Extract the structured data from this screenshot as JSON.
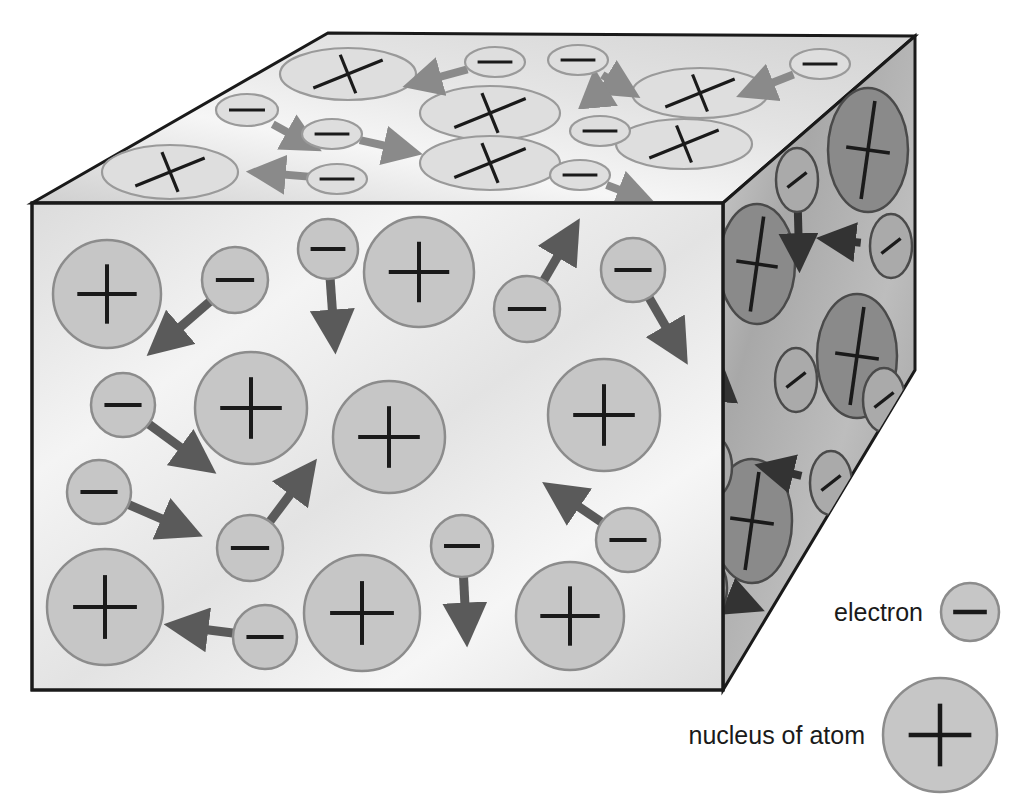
{
  "figure": {
    "background_color": "#ffffff",
    "edge_color": "#1a1a1a"
  },
  "colors": {
    "front_face_light": "#f2f2f2",
    "front_face_mid": "#d9d9d9",
    "front_particle_fill": "#c6c6c6",
    "front_particle_stroke": "#8c8c8c",
    "top_face_light": "#f7f7f7",
    "top_face_mid": "#d4d4d4",
    "top_particle_fill": "#dedede",
    "top_particle_stroke": "#9a9a9a",
    "right_face_light": "#c2c2c2",
    "right_face_mid": "#9c9c9c",
    "right_nucleus_fill": "#8a8a8a",
    "right_electron_fill": "#aaaaaa",
    "right_particle_stroke": "#4a4a4a",
    "arrow_front": "#5a5a5a",
    "arrow_top": "#8a8a8a",
    "arrow_right": "#333333",
    "glyph_color": "#1a1a1a",
    "legend_fill": "#c6c6c6",
    "legend_stroke": "#8c8c8c",
    "legend_text": "#1a1a1a"
  },
  "geometry": {
    "front_face": {
      "x1": 32,
      "y1": 203,
      "x2": 723,
      "y2": 690
    },
    "top_face_points": "32,203 328,33 915,36 723,203",
    "right_face_points": "723,203 915,36 915,370 723,690",
    "cube_note": "isometric block: front rectangle, top parallelogram, right face"
  },
  "legend": {
    "items": [
      {
        "label": "electron",
        "symbol": "minus",
        "cx": 970,
        "cy": 612,
        "r": 29
      },
      {
        "label": "nucleus of atom",
        "symbol": "plus",
        "cx": 940,
        "cy": 735,
        "r": 57
      }
    ]
  },
  "chart_data": {
    "type": "diagram",
    "front_face": {
      "nuclei": [
        {
          "cx": 107,
          "cy": 294,
          "r": 54
        },
        {
          "cx": 251,
          "cy": 408,
          "r": 56
        },
        {
          "cx": 419,
          "cy": 272,
          "r": 55
        },
        {
          "cx": 389,
          "cy": 437,
          "r": 56
        },
        {
          "cx": 604,
          "cy": 415,
          "r": 56
        },
        {
          "cx": 105,
          "cy": 607,
          "r": 58
        },
        {
          "cx": 362,
          "cy": 613,
          "r": 58
        },
        {
          "cx": 570,
          "cy": 616,
          "r": 54
        }
      ],
      "electrons": [
        {
          "cx": 235,
          "cy": 280,
          "r": 33,
          "arrow": {
            "dx": -72,
            "dy": 62
          }
        },
        {
          "cx": 328,
          "cy": 249,
          "r": 30,
          "arrow": {
            "dx": 6,
            "dy": 84
          }
        },
        {
          "cx": 527,
          "cy": 309,
          "r": 33,
          "arrow": {
            "dx": 42,
            "dy": -72
          }
        },
        {
          "cx": 633,
          "cy": 270,
          "r": 32,
          "arrow": {
            "dx": 44,
            "dy": 76
          }
        },
        {
          "cx": 123,
          "cy": 405,
          "r": 32,
          "arrow": {
            "dx": 76,
            "dy": 56
          }
        },
        {
          "cx": 99,
          "cy": 492,
          "r": 32,
          "arrow": {
            "dx": 84,
            "dy": 36
          }
        },
        {
          "cx": 250,
          "cy": 548,
          "r": 33,
          "arrow": {
            "dx": 54,
            "dy": -72
          }
        },
        {
          "cx": 462,
          "cy": 546,
          "r": 31,
          "arrow": {
            "dx": 4,
            "dy": 80
          }
        },
        {
          "cx": 628,
          "cy": 540,
          "r": 32,
          "arrow": {
            "dx": -68,
            "dy": -46
          }
        },
        {
          "cx": 265,
          "cy": 637,
          "r": 32,
          "arrow": {
            "dx": -80,
            "dy": -10
          }
        }
      ]
    },
    "top_face": {
      "nuclei": [
        {
          "cx": 348,
          "cy": 74,
          "rx": 68,
          "ry": 26
        },
        {
          "cx": 490,
          "cy": 113,
          "rx": 70,
          "ry": 27
        },
        {
          "cx": 700,
          "cy": 93,
          "rx": 68,
          "ry": 25
        },
        {
          "cx": 684,
          "cy": 144,
          "rx": 68,
          "ry": 25
        },
        {
          "cx": 490,
          "cy": 163,
          "rx": 70,
          "ry": 27
        },
        {
          "cx": 170,
          "cy": 172,
          "rx": 68,
          "ry": 27
        }
      ],
      "electrons": [
        {
          "cx": 247,
          "cy": 110,
          "rx": 31,
          "ry": 16,
          "arrow": {
            "dx": 58,
            "dy": 32
          }
        },
        {
          "cx": 495,
          "cy": 62,
          "rx": 30,
          "ry": 15,
          "arrow": {
            "dx": -74,
            "dy": 20
          }
        },
        {
          "cx": 578,
          "cy": 60,
          "rx": 30,
          "ry": 15,
          "arrow": {
            "dx": 46,
            "dy": 28
          }
        },
        {
          "cx": 332,
          "cy": 134,
          "rx": 30,
          "ry": 15,
          "arrow": {
            "dx": 72,
            "dy": 16
          }
        },
        {
          "cx": 600,
          "cy": 131,
          "rx": 30,
          "ry": 15,
          "arrow": {
            "dx": -4,
            "dy": -44
          }
        },
        {
          "cx": 820,
          "cy": 64,
          "rx": 30,
          "ry": 15,
          "arrow": {
            "dx": -66,
            "dy": 26
          }
        },
        {
          "cx": 337,
          "cy": 179,
          "rx": 30,
          "ry": 15,
          "arrow": {
            "dx": -72,
            "dy": -6
          }
        },
        {
          "cx": 580,
          "cy": 175,
          "rx": 30,
          "ry": 15,
          "arrow": {
            "dx": 58,
            "dy": 22
          }
        }
      ]
    },
    "right_face": {
      "nuclei": [
        {
          "cx": 868,
          "cy": 150,
          "rx": 40,
          "ry": 62
        },
        {
          "cx": 757,
          "cy": 264,
          "rx": 38,
          "ry": 60
        },
        {
          "cx": 857,
          "cy": 356,
          "rx": 40,
          "ry": 62
        },
        {
          "cx": 752,
          "cy": 521,
          "rx": 40,
          "ry": 62
        }
      ],
      "electrons": [
        {
          "cx": 797,
          "cy": 180,
          "rx": 21,
          "ry": 32,
          "arrow": {
            "dx": 2,
            "dy": 74
          }
        },
        {
          "cx": 700,
          "cy": 243,
          "rx": 20,
          "ry": 31,
          "arrow": {
            "dx": 0,
            "dy": 76
          }
        },
        {
          "cx": 891,
          "cy": 246,
          "rx": 21,
          "ry": 32,
          "arrow": {
            "dx": -56,
            "dy": -6
          }
        },
        {
          "cx": 796,
          "cy": 380,
          "rx": 21,
          "ry": 32,
          "arrow": {
            "dx": 0,
            "dy": 0
          }
        },
        {
          "cx": 884,
          "cy": 400,
          "rx": 21,
          "ry": 32,
          "arrow": {
            "dx": 2,
            "dy": 80
          }
        },
        {
          "cx": 712,
          "cy": 467,
          "rx": 20,
          "ry": 31,
          "arrow": {
            "dx": 8,
            "dy": -86
          }
        },
        {
          "cx": 831,
          "cy": 483,
          "rx": 21,
          "ry": 32,
          "arrow": {
            "dx": -58,
            "dy": -14
          }
        },
        {
          "cx": 707,
          "cy": 588,
          "rx": 20,
          "ry": 31,
          "arrow": {
            "dx": 40,
            "dy": 16
          }
        }
      ]
    }
  }
}
